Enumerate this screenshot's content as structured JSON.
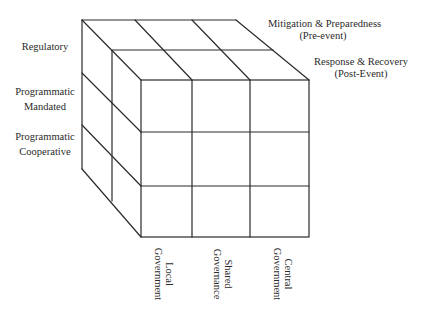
{
  "diagram": {
    "type": "3x3x2 perspective cube matrix",
    "line_color": "#2b2b2b",
    "background": "#ffffff",
    "row_labels": [
      {
        "lines": [
          "Regulatory"
        ]
      },
      {
        "lines": [
          "Programmatic",
          "Mandated"
        ]
      },
      {
        "lines": [
          "Programmatic",
          "Cooperative"
        ]
      }
    ],
    "depth_labels": [
      {
        "lines": [
          "Mitigation & Preparedness",
          "(Pre-event)"
        ]
      },
      {
        "lines": [
          "Response & Recovery",
          "(Post-Event)"
        ]
      }
    ],
    "column_labels": [
      {
        "lines": [
          "Local",
          "Government"
        ]
      },
      {
        "lines": [
          "Shared",
          "Governance"
        ]
      },
      {
        "lines": [
          "Central",
          "Government"
        ]
      }
    ]
  }
}
